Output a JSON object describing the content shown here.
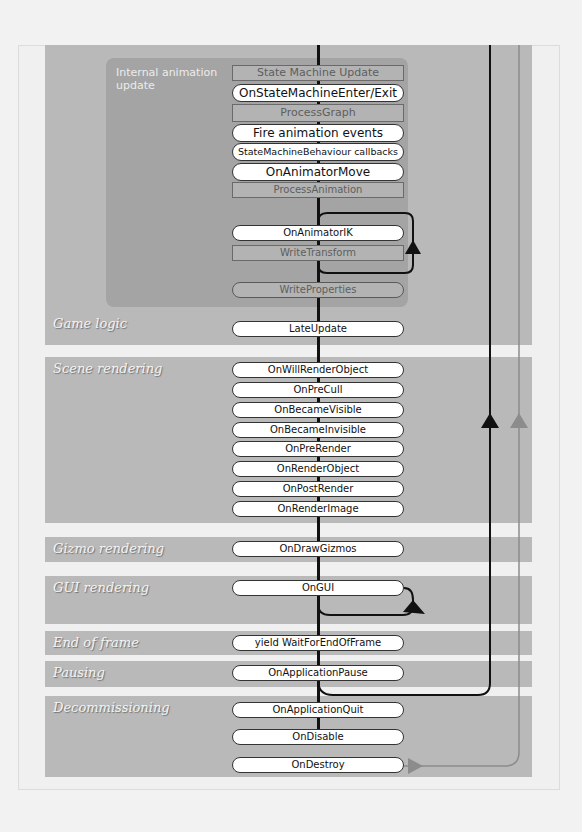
{
  "diagram": {
    "title_region": "Unity script lifecycle (partial)",
    "sections": [
      {
        "id": "internal-animation-update",
        "label": "Internal animation update"
      },
      {
        "id": "game-logic",
        "label": "Game logic"
      },
      {
        "id": "scene-rendering",
        "label": "Scene rendering"
      },
      {
        "id": "gizmo-rendering",
        "label": "Gizmo rendering"
      },
      {
        "id": "gui-rendering",
        "label": "GUI rendering"
      },
      {
        "id": "end-of-frame",
        "label": "End of frame"
      },
      {
        "id": "pausing",
        "label": "Pausing"
      },
      {
        "id": "decommissioning",
        "label": "Decommissioning"
      }
    ],
    "animation_steps": [
      {
        "label": "State Machine Update",
        "kind": "internal"
      },
      {
        "label": "OnStateMachineEnter/Exit",
        "kind": "callback"
      },
      {
        "label": "ProcessGraph",
        "kind": "internal"
      },
      {
        "label": "Fire animation events",
        "kind": "callback"
      },
      {
        "label": "StateMachineBehaviour callbacks",
        "kind": "callback"
      },
      {
        "label": "OnAnimatorMove",
        "kind": "callback"
      },
      {
        "label": "ProcessAnimation",
        "kind": "internal"
      },
      {
        "label": "OnAnimatorIK",
        "kind": "callback"
      },
      {
        "label": "WriteTransform",
        "kind": "internal"
      },
      {
        "label": "WriteProperties",
        "kind": "internal"
      }
    ],
    "game_logic": [
      "LateUpdate"
    ],
    "scene_rendering": [
      "OnWillRenderObject",
      "OnPreCull",
      "OnBecameVisible",
      "OnBecameInvisible",
      "OnPreRender",
      "OnRenderObject",
      "OnPostRender",
      "OnRenderImage"
    ],
    "gizmo_rendering": [
      "OnDrawGizmos"
    ],
    "gui_rendering": [
      "OnGUI"
    ],
    "end_of_frame": [
      "yield WaitForEndOfFrame"
    ],
    "pausing": [
      "OnApplicationPause"
    ],
    "decommissioning": [
      "OnApplicationQuit",
      "OnDisable",
      "OnDestroy"
    ],
    "colors": {
      "band": "#b9b9b9",
      "anim_box": "#a4a4a4",
      "flow_line": "#111111",
      "exit_line": "#8c8c8c",
      "pill_fill": "#ffffff"
    }
  }
}
